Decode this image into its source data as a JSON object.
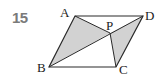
{
  "problem_number": "15",
  "colors": {
    "shade": "#d2d2d2",
    "stroke": "#2a2a2a",
    "number": "#7a7a7a"
  },
  "points": {
    "A": {
      "label": "A",
      "x": 75,
      "y": 16
    },
    "B": {
      "label": "B",
      "x": 49,
      "y": 67
    },
    "C": {
      "label": "C",
      "x": 116,
      "y": 67
    },
    "D": {
      "label": "D",
      "x": 143,
      "y": 16
    },
    "P": {
      "label": "P",
      "x": 110,
      "y": 33
    }
  },
  "shaded_triangles": [
    "ABP",
    "PCD"
  ],
  "segments": [
    "AB",
    "BC",
    "CD",
    "DA",
    "BD",
    "AP",
    "PC"
  ]
}
